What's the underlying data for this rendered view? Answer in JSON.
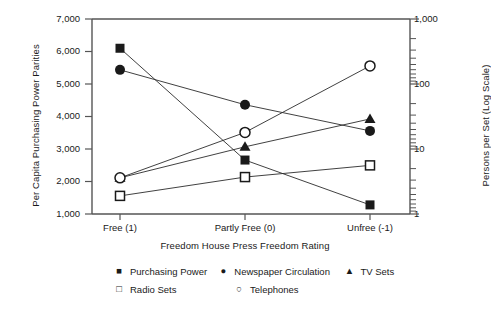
{
  "chart_data": {
    "type": "line",
    "title": "",
    "xlabel": "Freedom House Press Freedom Rating",
    "ylabel": "Per Capita Purchasing Power Parities",
    "ylabel_right": "Persons per Set (Log Scale)",
    "categories": [
      "Free (1)",
      "Partly Free (0)",
      "Unfree (-1)"
    ],
    "ylim": [
      1000,
      7000
    ],
    "yticks": [
      "1,000",
      "2,000",
      "3,000",
      "4,000",
      "5,000",
      "6,000",
      "7,000"
    ],
    "ylim_right": [
      1,
      1000
    ],
    "yticks_right": [
      "1",
      "10",
      "100",
      "1,000"
    ],
    "right_axis_scale": "log",
    "grid": false,
    "legend_position": "bottom",
    "series": [
      {
        "name": "Purchasing Power",
        "marker": "filled-square",
        "axis": "left",
        "values": [
          6100,
          2660,
          1280
        ]
      },
      {
        "name": "Newspaper Circulation",
        "marker": "filled-circle",
        "axis": "right",
        "values": [
          165,
          48,
          19
        ]
      },
      {
        "name": "TV Sets",
        "marker": "filled-triangle",
        "axis": "right",
        "values": [
          3.6,
          10.8,
          29
        ]
      },
      {
        "name": "Radio Sets",
        "marker": "open-square",
        "axis": "right",
        "values": [
          1.9,
          3.7,
          5.6
        ]
      },
      {
        "name": "Telephones",
        "marker": "open-circle",
        "axis": "right",
        "values": [
          3.6,
          18,
          190
        ]
      }
    ]
  },
  "axes": {
    "left_title": "Per Capita Purchasing Power Parities",
    "right_title": "Persons per Set (Log Scale)",
    "x_title": "Freedom House Press Freedom Rating",
    "left_ticks": [
      "7,000",
      "6,000",
      "5,000",
      "4,000",
      "3,000",
      "2,000",
      "1,000"
    ],
    "right_ticks": [
      "1,000",
      "100",
      "10",
      "1"
    ],
    "x_ticks": [
      "Free (1)",
      "Partly Free (0)",
      "Unfree (-1)"
    ]
  },
  "legend": {
    "row1": [
      {
        "label": "Purchasing Power",
        "glyph": "■"
      },
      {
        "label": "Newspaper Circulation",
        "glyph": "●"
      },
      {
        "label": "TV Sets",
        "glyph": "▲"
      }
    ],
    "row2": [
      {
        "label": "Radio Sets",
        "glyph": "□"
      },
      {
        "label": "Telephones",
        "glyph": "○"
      }
    ]
  }
}
